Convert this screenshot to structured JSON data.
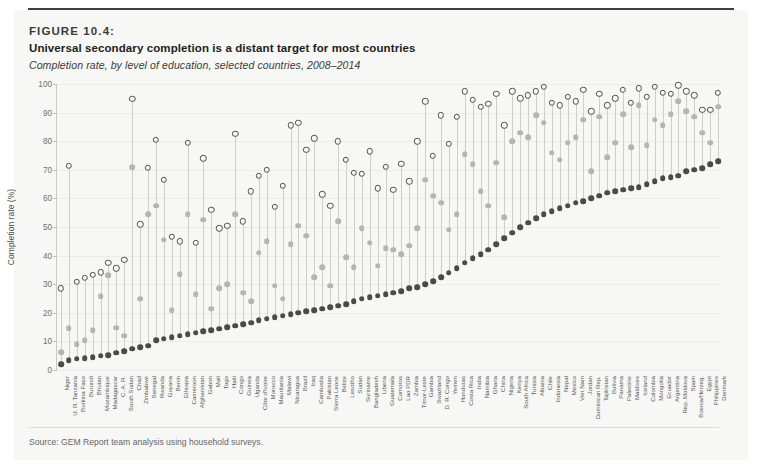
{
  "figure": {
    "number": "FIGURE 10.4:",
    "title": "Universal secondary completion is a distant target for most countries",
    "subtitle": "Completion rate, by level of education, selected countries, 2008–2014",
    "source": "Source: GEM Report team analysis using household surveys."
  },
  "chart_data": {
    "type": "scatter",
    "title": "Universal secondary completion is a distant target for most countries",
    "subtitle": "Completion rate, by level of education, selected countries, 2008–2014",
    "xlabel": "",
    "ylabel": "Completion rate (%)",
    "ylim": [
      0,
      100
    ],
    "yticks": [
      0,
      10,
      20,
      30,
      40,
      50,
      60,
      70,
      80,
      90,
      100
    ],
    "grid": "horizontal",
    "legend_position": "none",
    "series_style": {
      "primary": {
        "marker": "open-circle",
        "color": "#4f4f4f"
      },
      "lower_secondary": {
        "marker": "filled-circle",
        "color": "#b4b4b0"
      },
      "upper_secondary": {
        "marker": "filled-circle",
        "color": "#4a4a4a"
      }
    },
    "categories": [
      "Niger",
      "U. R. Tanzania",
      "Burkina Faso",
      "Burundi",
      "Bhutan",
      "Mozambique",
      "Madagascar",
      "C. A. R.",
      "South Sudan",
      "Chad",
      "Zimbabwe",
      "Senegal",
      "Rwanda",
      "Guyana",
      "Benin",
      "Ethiopia",
      "Cameroon",
      "Afghanistan",
      "Gabon",
      "Mali",
      "Togo",
      "Haiti",
      "Congo",
      "Guinea",
      "Uganda",
      "Côte d'Ivoire",
      "Morocco",
      "Mauritania",
      "Malawi",
      "Nicaragua",
      "Brazil",
      "Iraq",
      "Cambodia",
      "Pakistan",
      "Sierra Leone",
      "Belize",
      "Lesotho",
      "Sudan",
      "Suriname",
      "Bangladesh",
      "Liberia",
      "Guatemala",
      "Comoros",
      "Lao PDR",
      "Zambia",
      "Timor-Leste",
      "Gambia",
      "Swaziland",
      "D. R. Congo",
      "Yemen",
      "Honduras",
      "Costa Rica",
      "India",
      "Namibia",
      "Ghana",
      "China",
      "Nigeria",
      "Kenya",
      "South Africa",
      "Tunisia",
      "Albania",
      "Chile",
      "Indonesia",
      "Nepal",
      "Mexico",
      "Viet Nam",
      "Jordan",
      "Dominican Rep.",
      "Tajikistan",
      "Bolivia",
      "Panama",
      "Palestine",
      "Maldives",
      "Iceland",
      "Colombia",
      "Mongolia",
      "Ecuador",
      "Argentina",
      "Rep. Moldova",
      "Spain",
      "Bosnia/Herzeg.",
      "Egypt",
      "Philippines",
      "Denmark"
    ],
    "series": [
      {
        "name": "Primary",
        "key": "primary",
        "values": [
          28.5,
          71.5,
          30.8,
          32.3,
          33.3,
          34.2,
          37.5,
          35.5,
          38.5,
          94.8,
          51.0,
          70.8,
          80.5,
          66.5,
          46.5,
          45.0,
          79.5,
          44.5,
          74.0,
          56.0,
          49.5,
          50.5,
          82.5,
          52.0,
          62.5,
          68.0,
          70.0,
          57.0,
          64.5,
          85.5,
          86.5,
          77.0,
          81.0,
          61.5,
          57.5,
          80.0,
          73.5,
          69.0,
          68.5,
          76.5,
          63.5,
          71.0,
          63.0,
          72.0,
          66.0,
          80.0,
          94.0,
          75.0,
          89.0,
          79.0,
          88.5,
          97.5,
          94.5,
          92.0,
          93.0,
          96.5,
          85.5,
          97.5,
          95.0,
          96.0,
          97.5,
          99.0,
          93.5,
          92.5,
          95.5,
          94.0,
          98.0,
          90.5,
          96.5,
          92.5,
          95.0,
          98.0,
          93.5,
          98.5,
          95.5,
          99.0,
          97.0,
          96.5,
          99.5,
          97.5,
          96.0,
          91.0,
          91.0,
          97.0
        ]
      },
      {
        "name": "Lower secondary",
        "key": "lower_secondary",
        "values": [
          6.2,
          14.6,
          9.0,
          10.5,
          14.0,
          25.8,
          33.2,
          14.8,
          12.0,
          71.0,
          25.0,
          54.5,
          57.5,
          45.5,
          21.0,
          33.5,
          54.5,
          26.5,
          52.5,
          21.5,
          28.5,
          30.0,
          54.5,
          27.0,
          24.0,
          41.0,
          45.0,
          29.5,
          25.0,
          44.0,
          50.5,
          47.0,
          32.5,
          36.0,
          29.5,
          52.0,
          39.5,
          36.0,
          49.5,
          44.5,
          36.5,
          42.5,
          42.0,
          40.5,
          43.5,
          49.5,
          66.5,
          61.0,
          58.5,
          49.0,
          54.5,
          75.5,
          72.0,
          62.5,
          57.5,
          72.5,
          53.5,
          80.0,
          83.0,
          81.5,
          89.0,
          86.5,
          76.0,
          73.5,
          79.5,
          81.5,
          87.5,
          69.5,
          88.5,
          74.5,
          79.5,
          89.5,
          78.0,
          92.5,
          78.5,
          87.5,
          85.5,
          89.5,
          94.0,
          90.5,
          88.5,
          83.0,
          79.5,
          92.0
        ]
      },
      {
        "name": "Upper secondary",
        "key": "upper_secondary",
        "values": [
          2.0,
          3.5,
          4.0,
          4.2,
          4.5,
          5.0,
          5.2,
          6.0,
          6.5,
          7.5,
          8.0,
          8.5,
          10.5,
          11.0,
          11.5,
          12.0,
          12.5,
          13.0,
          13.5,
          14.0,
          14.5,
          15.0,
          15.5,
          16.0,
          16.5,
          17.5,
          18.0,
          18.5,
          19.0,
          19.5,
          20.0,
          20.5,
          21.0,
          21.5,
          22.0,
          22.5,
          23.0,
          24.0,
          25.0,
          25.5,
          26.0,
          26.5,
          27.0,
          27.5,
          28.5,
          29.0,
          30.0,
          31.0,
          32.5,
          34.0,
          35.5,
          37.5,
          39.0,
          40.5,
          42.0,
          44.0,
          46.0,
          48.0,
          50.0,
          51.5,
          53.0,
          54.5,
          55.5,
          56.5,
          57.5,
          58.5,
          59.0,
          60.0,
          61.0,
          62.0,
          62.5,
          63.0,
          63.5,
          64.0,
          65.0,
          66.0,
          67.0,
          67.5,
          68.0,
          69.5,
          70.0,
          70.5,
          72.0,
          73.0
        ]
      }
    ]
  }
}
